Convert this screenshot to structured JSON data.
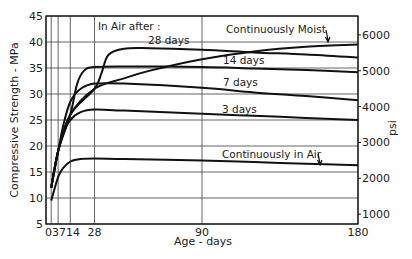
{
  "chart_data": {
    "type": "line",
    "title": "",
    "xlabel": "Age - days",
    "ylabel": "Compressive Strength - MPa",
    "ylabel_right": "psi",
    "xlim": [
      0,
      180
    ],
    "ylim": [
      5,
      45
    ],
    "x_ticks": [
      0,
      3,
      7,
      14,
      28,
      90,
      180
    ],
    "x_tick_labels": [
      "0",
      "3",
      "7",
      "14",
      "28",
      "90",
      "180"
    ],
    "y_ticks": [
      5,
      10,
      15,
      20,
      25,
      30,
      35,
      40,
      45
    ],
    "y_tick_labels": [
      "5",
      "10",
      "15",
      "20",
      "25",
      "30",
      "35",
      "40",
      "45"
    ],
    "y_right_ticks": [
      1000,
      2000,
      3000,
      4000,
      5000,
      6000
    ],
    "y_right_tick_labels": [
      "1000",
      "2000",
      "3000",
      "4000",
      "5000",
      "6000"
    ],
    "grid": true,
    "annotations": {
      "group_title": "In Air after :",
      "moist": "Continuously  Moist",
      "d28": "28 days",
      "d14": "14 days",
      "d7": "7 days",
      "d3": "3 days",
      "air": "Continuously in Air"
    },
    "series": [
      {
        "name": "Continuously Moist",
        "x": [
          3,
          7,
          14,
          28,
          45,
          60,
          90,
          120,
          150,
          180
        ],
        "values": [
          12,
          19,
          26,
          31,
          33,
          34.5,
          36.7,
          38.2,
          39.1,
          39.5
        ]
      },
      {
        "name": "In Air after 28 days",
        "x": [
          3,
          7,
          14,
          28,
          32,
          36,
          45,
          60,
          90,
          120,
          150,
          180
        ],
        "values": [
          12,
          19,
          26,
          31,
          34,
          37.5,
          38.7,
          38.8,
          38.5,
          38.0,
          37.6,
          37.0
        ]
      },
      {
        "name": "In Air after 14 days",
        "x": [
          3,
          7,
          14,
          18,
          22,
          28,
          45,
          90,
          120,
          150,
          180
        ],
        "values": [
          12,
          19,
          26,
          32,
          34.5,
          35.2,
          35.3,
          35.2,
          34.9,
          34.6,
          34.2
        ]
      },
      {
        "name": "In Air after 7 days",
        "x": [
          3,
          7,
          10,
          14,
          20,
          28,
          45,
          90,
          120,
          150,
          180
        ],
        "values": [
          12,
          19,
          24,
          28.5,
          31,
          32,
          32,
          31.2,
          30.3,
          29.6,
          28.8
        ]
      },
      {
        "name": "In Air after 3 days",
        "x": [
          3,
          7,
          10,
          14,
          20,
          28,
          45,
          90,
          120,
          150,
          180
        ],
        "values": [
          12,
          19,
          22.5,
          25,
          26.5,
          27,
          26.8,
          26.2,
          25.8,
          25.4,
          25.0
        ]
      },
      {
        "name": "Continuously in Air",
        "x": [
          3,
          7,
          10,
          14,
          20,
          28,
          45,
          90,
          120,
          150,
          180
        ],
        "values": [
          9.5,
          14,
          15.8,
          17,
          17.5,
          17.6,
          17.5,
          17.2,
          16.9,
          16.6,
          16.3
        ]
      }
    ]
  }
}
